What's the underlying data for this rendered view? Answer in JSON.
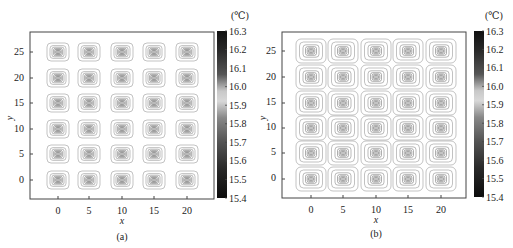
{
  "chart_data": [
    {
      "type": "heatmap",
      "subtype": "contour",
      "panel_label": "(a)",
      "xlabel": "x",
      "ylabel": "y",
      "x_ticks": [
        0,
        5,
        10,
        15,
        20
      ],
      "y_ticks": [
        0,
        5,
        10,
        15,
        20,
        25
      ],
      "xlim": [
        -4,
        24
      ],
      "ylim": [
        -4,
        29
      ],
      "grid": false,
      "sources": {
        "x": [
          0,
          5,
          10,
          15,
          20
        ],
        "y": [
          0,
          5,
          10,
          15,
          20,
          25
        ],
        "count": 30,
        "contour_extent": "compact (~±2.5 units)"
      },
      "colorbar": {
        "unit": "(℃)",
        "min": 15.4,
        "max": 16.3,
        "ticks": [
          16.3,
          16.2,
          16.1,
          16.0,
          15.9,
          15.8,
          15.7,
          15.6,
          15.5,
          15.4
        ],
        "tick_labels": [
          "16.3",
          "16.2",
          "16.1",
          "16.0",
          "15.9",
          "15.8",
          "15.7",
          "15.6",
          "15.5",
          "15.4"
        ],
        "colormap": "grayscale (dark at ends, light near 16.0)"
      }
    },
    {
      "type": "heatmap",
      "subtype": "contour",
      "panel_label": "(b)",
      "xlabel": "x",
      "ylabel": "y",
      "x_ticks": [
        0,
        5,
        10,
        15,
        20
      ],
      "y_ticks": [
        0,
        5,
        10,
        15,
        20,
        25
      ],
      "xlim": [
        -4,
        24
      ],
      "ylim": [
        -4,
        29
      ],
      "grid": false,
      "sources": {
        "x": [
          0,
          5,
          10,
          15,
          20
        ],
        "y": [
          0,
          5,
          10,
          15,
          20,
          25
        ],
        "count": 30,
        "contour_extent": "wide (~±3 units, cells nearly touching)"
      },
      "colorbar": {
        "unit": "(℃)",
        "min": 15.4,
        "max": 16.3,
        "ticks": [
          16.3,
          16.2,
          16.1,
          16.0,
          15.9,
          15.8,
          15.7,
          15.6,
          15.5,
          15.4
        ],
        "tick_labels": [
          "16.3",
          "16.2",
          "16.1",
          "16.0",
          "15.9",
          "15.8",
          "15.7",
          "15.6",
          "15.5",
          "15.4"
        ],
        "colormap": "grayscale (dark at ends, light near 16.0)"
      }
    }
  ],
  "panels": {
    "a": {
      "caption": "(a)",
      "xlabel": "x",
      "ylabel": "y",
      "x_tick_labels": [
        "0",
        "5",
        "10",
        "15",
        "20"
      ],
      "y_tick_labels": [
        "25",
        "20",
        "15",
        "10",
        "5",
        "0"
      ],
      "colorbar_unit": "(℃)",
      "colorbar_labels": [
        "16.3",
        "16.2",
        "16.1",
        "16.0",
        "15.9",
        "15.8",
        "15.7",
        "15.6",
        "15.5",
        "15.4"
      ]
    },
    "b": {
      "caption": "(b)",
      "xlabel": "x",
      "ylabel": "y",
      "x_tick_labels": [
        "0",
        "5",
        "10",
        "15",
        "20"
      ],
      "y_tick_labels": [
        "25",
        "20",
        "15",
        "10",
        "5",
        "0"
      ],
      "colorbar_unit": "(℃)",
      "colorbar_labels": [
        "16.3",
        "16.2",
        "16.1",
        "16.0",
        "15.9",
        "15.8",
        "15.7",
        "15.6",
        "15.5",
        "15.4"
      ]
    }
  }
}
